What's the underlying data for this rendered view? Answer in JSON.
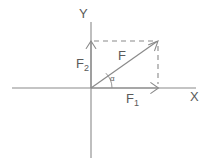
{
  "figure": {
    "type": "vector-decomposition-diagram",
    "background_color": "#ffffff",
    "line_color": "#8a8a8a",
    "text_color": "#5a5a5a"
  },
  "axes": {
    "x_label": "X",
    "y_label": "Y",
    "origin": {
      "x": 91,
      "y": 88
    }
  },
  "vectors": {
    "resultant": {
      "label": "F",
      "from": {
        "x": 91,
        "y": 88
      },
      "to": {
        "x": 158,
        "y": 41
      }
    },
    "x_component": {
      "label": "F",
      "subscript": "1",
      "from": {
        "x": 91,
        "y": 88
      },
      "to": {
        "x": 158,
        "y": 88
      }
    },
    "y_component": {
      "label": "F",
      "subscript": "2",
      "from": {
        "x": 91,
        "y": 88
      },
      "to": {
        "x": 91,
        "y": 41
      }
    }
  },
  "angle": {
    "label": "α",
    "vertex": {
      "x": 91,
      "y": 88
    },
    "between": [
      "x_component",
      "resultant"
    ]
  },
  "construction_lines": {
    "horizontal_dashed": {
      "from": {
        "x": 93,
        "y": 41
      },
      "to": {
        "x": 157,
        "y": 41
      }
    },
    "vertical_dashed": {
      "from": {
        "x": 158,
        "y": 44
      },
      "to": {
        "x": 158,
        "y": 85
      }
    }
  }
}
